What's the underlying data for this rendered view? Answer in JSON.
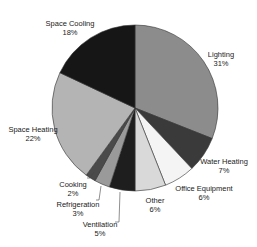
{
  "chart_data": {
    "type": "pie",
    "title": "",
    "start_angle_deg": 0,
    "direction": "clockwise",
    "categories": [
      "Lighting",
      "Water Heating",
      "Office Equipment",
      "Other",
      "Ventilation",
      "Refrigeration",
      "Cooking",
      "Space Heating",
      "Space Cooling"
    ],
    "values": [
      31,
      7,
      6,
      6,
      5,
      3,
      2,
      22,
      18
    ],
    "value_labels": [
      "31%",
      "7%",
      "6%",
      "6%",
      "5%",
      "3%",
      "2%",
      "22%",
      "18%"
    ],
    "colors": [
      "#8c8c8c",
      "#3a3a3a",
      "#f4f4f4",
      "#d9d9d9",
      "#1e1e1e",
      "#9a9a9a",
      "#4a4a4a",
      "#b4b4b4",
      "#161616"
    ],
    "legend": "none",
    "labels_outside": true
  },
  "labels": [
    {
      "name": "Lighting",
      "pct": "31%",
      "x": 221,
      "y": 50
    },
    {
      "name": "Water Heating",
      "pct": "7%",
      "x": 224,
      "y": 157
    },
    {
      "name": "Office Equipment",
      "pct": "6%",
      "x": 204,
      "y": 184
    },
    {
      "name": "Other",
      "pct": "6%",
      "x": 155,
      "y": 196
    },
    {
      "name": "Ventilation",
      "pct": "5%",
      "x": 100,
      "y": 220
    },
    {
      "name": "Refrigeration",
      "pct": "3%",
      "x": 78,
      "y": 200
    },
    {
      "name": "Cooking",
      "pct": "2%",
      "x": 73,
      "y": 180
    },
    {
      "name": "Space Heating",
      "pct": "22%",
      "x": 33,
      "y": 125
    },
    {
      "name": "Space Cooling",
      "pct": "18%",
      "x": 70,
      "y": 19
    }
  ]
}
